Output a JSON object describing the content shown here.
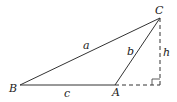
{
  "diagram": {
    "type": "triangle-with-altitude",
    "vertices": {
      "A": "A",
      "B": "B",
      "C": "C"
    },
    "sides": {
      "a": "a",
      "b": "b",
      "c": "c"
    },
    "altitude": "h",
    "colors": {
      "line": "#333333",
      "text": "#222222"
    }
  }
}
